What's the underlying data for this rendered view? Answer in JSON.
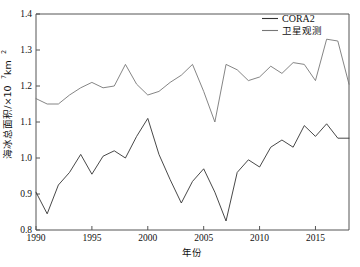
{
  "chart_data": {
    "type": "line",
    "title": "",
    "xlabel": "年份",
    "ylabel": "海冰总面积/×10⁷ km²",
    "ylabel_parts": {
      "main": "海冰总面积/×10",
      "exp": "7",
      "unit": " km",
      "unit_exp": "2"
    },
    "xlim": [
      1990,
      2018
    ],
    "ylim": [
      0.8,
      1.4
    ],
    "xticks": [
      1990,
      1995,
      2000,
      2005,
      2010,
      2015
    ],
    "yticks": [
      "0.8",
      "0.9",
      "1.0",
      "1.1",
      "1.2",
      "1.3",
      "1.4"
    ],
    "grid": false,
    "legend_position": "top-right",
    "x": [
      1990,
      1991,
      1992,
      1993,
      1994,
      1995,
      1996,
      1997,
      1998,
      1999,
      2000,
      2001,
      2002,
      2003,
      2004,
      2005,
      2006,
      2007,
      2008,
      2009,
      2010,
      2011,
      2012,
      2013,
      2014,
      2015,
      2016,
      2017,
      2018
    ],
    "series": [
      {
        "name": "CORA2",
        "color": "#333333",
        "values": [
          0.905,
          0.845,
          0.925,
          0.96,
          1.01,
          0.955,
          1.005,
          1.02,
          1.0,
          1.06,
          1.11,
          1.01,
          0.94,
          0.875,
          0.935,
          0.97,
          0.905,
          0.825,
          0.96,
          0.995,
          0.975,
          1.03,
          1.05,
          1.03,
          1.09,
          1.06,
          1.095,
          1.055,
          1.055
        ]
      },
      {
        "name": "卫星观测",
        "color": "#777777",
        "values": [
          1.165,
          1.15,
          1.15,
          1.175,
          1.195,
          1.21,
          1.195,
          1.2,
          1.26,
          1.205,
          1.175,
          1.185,
          1.21,
          1.23,
          1.26,
          1.185,
          1.1,
          1.26,
          1.245,
          1.215,
          1.225,
          1.255,
          1.235,
          1.265,
          1.26,
          1.215,
          1.33,
          1.325,
          1.205
        ]
      }
    ],
    "legend": [
      {
        "label": "CORA2",
        "color": "#333333",
        "script": "latin"
      },
      {
        "label": "卫星观测",
        "color": "#777777",
        "script": "cjk"
      }
    ]
  }
}
